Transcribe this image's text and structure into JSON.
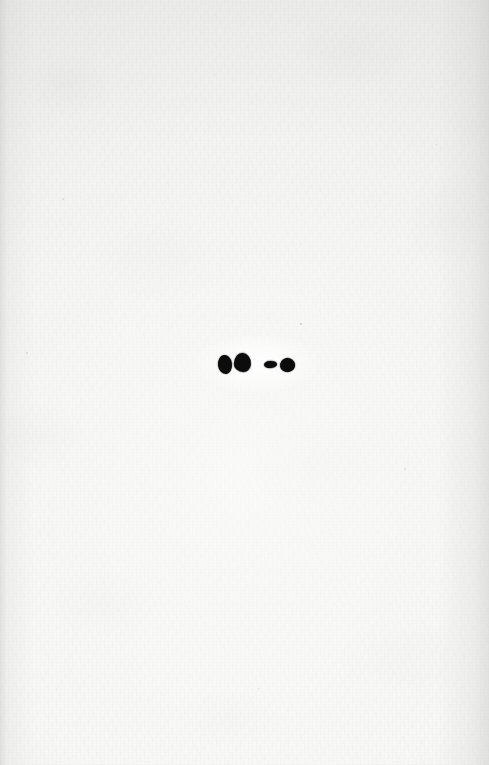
{
  "page": {
    "kind": "scanned-paper-page",
    "width": 489,
    "height": 765,
    "paper_color": "#f3f3f1",
    "paper_edge_shadow_color": "#bebebc",
    "ink_color": "#0d0c0c",
    "halo_color": "#ffffff",
    "caption": "",
    "text_content": "",
    "visible_text": []
  },
  "ink_marks": {
    "label": "",
    "count": 4,
    "reading": "two dots, a dash, and a dot",
    "items": [
      {
        "name": "dot-large-left",
        "shape": "dot",
        "x": 218,
        "y": 355,
        "width": 14,
        "height": 19,
        "rotation": -6
      },
      {
        "name": "dot-large-right",
        "shape": "dot",
        "x": 234,
        "y": 353,
        "width": 17,
        "height": 19,
        "rotation": 4
      },
      {
        "name": "dash-short",
        "shape": "dash",
        "x": 264,
        "y": 361,
        "width": 13,
        "height": 7,
        "rotation": -2
      },
      {
        "name": "dot-small-right",
        "shape": "dot",
        "x": 280,
        "y": 358,
        "width": 15,
        "height": 14,
        "rotation": -8
      }
    ]
  },
  "specks": {
    "items": [
      {
        "name": "ink-speck-upper-right",
        "x": 300,
        "y": 323,
        "size": 2.2
      },
      {
        "name": "dust-fleck-left-upper",
        "x": 62,
        "y": 198,
        "size": 1.6
      },
      {
        "name": "dust-fleck-left-mid",
        "x": 26,
        "y": 352,
        "size": 1.5
      },
      {
        "name": "dust-fleck-right-upper",
        "x": 436,
        "y": 144,
        "size": 1.4
      },
      {
        "name": "dust-fleck-right-mid",
        "x": 404,
        "y": 468,
        "size": 1.5
      },
      {
        "name": "dust-fleck-lower-left",
        "x": 118,
        "y": 610,
        "size": 1.4
      },
      {
        "name": "dust-fleck-lower-mid",
        "x": 258,
        "y": 688,
        "size": 1.3
      },
      {
        "name": "dust-fleck-top-mid",
        "x": 214,
        "y": 74,
        "size": 1.3
      }
    ]
  }
}
